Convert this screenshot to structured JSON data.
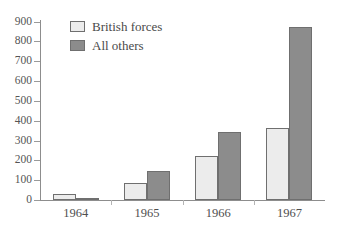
{
  "chart_data": {
    "type": "bar",
    "title": "",
    "xlabel": "",
    "ylabel": "",
    "categories": [
      "1964",
      "1965",
      "1966",
      "1967"
    ],
    "ylim": [
      0,
      900
    ],
    "yticks": [
      0,
      100,
      200,
      300,
      400,
      500,
      600,
      700,
      800,
      900
    ],
    "ytick_labels": [
      "0",
      "100",
      "200",
      "300",
      "400",
      "500",
      "600",
      "700",
      "800",
      "900"
    ],
    "grid": false,
    "legend_position": "inside-top-left",
    "series": [
      {
        "name": "British forces",
        "color": "#ececec",
        "edge_color": "#6f6f6f",
        "values": [
          30,
          85,
          220,
          365
        ]
      },
      {
        "name": "All others",
        "color": "#8c8c8c",
        "edge_color": "#6f6f6f",
        "values": [
          10,
          148,
          342,
          870
        ]
      }
    ]
  },
  "legend": {
    "items": [
      {
        "label": "British forces",
        "swatch": "light"
      },
      {
        "label": "All others",
        "swatch": "dark"
      }
    ]
  },
  "axes": {
    "y_axis_name": "y-axis",
    "x_axis_name": "x-axis"
  }
}
